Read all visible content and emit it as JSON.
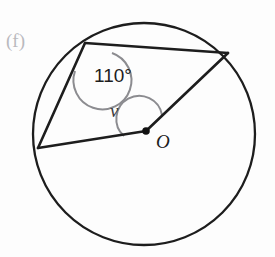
{
  "figure": {
    "part_label": "(f)"
  },
  "labels": {
    "inscribed_angle": "110°",
    "central_angle": "v",
    "centre": "O"
  },
  "colors": {
    "stroke": "#1d1d1d",
    "arc_marker": "#8c8c90",
    "background": "#fdfdfd",
    "part_label": "#b9b9bd",
    "centre_dot": "#111111"
  },
  "geometry": {
    "circle": {
      "cx": 144,
      "cy": 134,
      "r": 111
    },
    "centre_dot": {
      "x": 146,
      "y": 131,
      "r": 3.6
    },
    "points": {
      "top_left_vertex": {
        "x": 85,
        "y": 43
      },
      "right_vertex": {
        "x": 228,
        "y": 53
      },
      "left_vertex": {
        "x": 38,
        "y": 148
      }
    },
    "segments": [
      {
        "name": "chord-topleft-to-right",
        "from": "top_left_vertex",
        "to": "right_vertex"
      },
      {
        "name": "chord-topleft-to-left",
        "from": "top_left_vertex",
        "to": "left_vertex"
      },
      {
        "name": "radius-left-to-centre",
        "from": "left_vertex",
        "to": "centre"
      },
      {
        "name": "radius-centre-to-right",
        "from": "centre",
        "to": "right_vertex"
      }
    ],
    "label_positions": {
      "part_label": {
        "x": 6,
        "y": 47
      },
      "inscribed_angle": {
        "x": 95,
        "y": 81
      },
      "central_angle": {
        "x": 111,
        "y": 116
      },
      "centre": {
        "x": 157,
        "y": 147
      }
    }
  }
}
